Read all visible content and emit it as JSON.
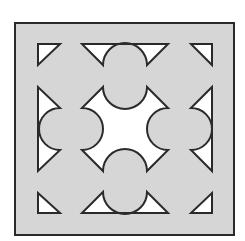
{
  "figure": {
    "colors": {
      "background": "#ffffff",
      "tile_fill": "#d6d6d6",
      "cutout_fill": "#ffffff",
      "stroke": "#2a2a2a"
    },
    "outer_square": {
      "x": 15,
      "y": 23,
      "width": 219,
      "height": 212
    },
    "shapes": [
      {
        "name": "corner-triangle-top-left",
        "d": "M38,44 L60,44 L38,65 Z"
      },
      {
        "name": "corner-triangle-top-right",
        "d": "M191,44 L212,44 L212,65 Z"
      },
      {
        "name": "corner-triangle-bottom-left",
        "d": "M38,193 L38,213 L60,213 Z"
      },
      {
        "name": "corner-triangle-bottom-right",
        "d": "M212,193 L212,213 L191,213 Z"
      },
      {
        "name": "edge-shape-top",
        "d": "M82,44 L168,44 L147,65 A22,22 0 0 0 103,65 Z"
      },
      {
        "name": "edge-shape-bottom",
        "d": "M82,213 L168,213 L147,192 A22,22 0 0 1 103,192 Z"
      },
      {
        "name": "edge-shape-left",
        "d": "M38,87 L38,171 L60,150 A21,21 0 0 1 60,108 Z"
      },
      {
        "name": "edge-shape-right",
        "d": "M212,87 L212,171 L191,150 A21,21 0 0 0 191,108 Z"
      },
      {
        "name": "center-star-shape",
        "d": "M103,87 A22,22 0 0 0 147,87 L168,108 A21,21 0 0 0 168,150 L147,171 A22,22 0 0 0 103,171 L82,150 A21,21 0 0 0 82,108 Z"
      }
    ]
  }
}
